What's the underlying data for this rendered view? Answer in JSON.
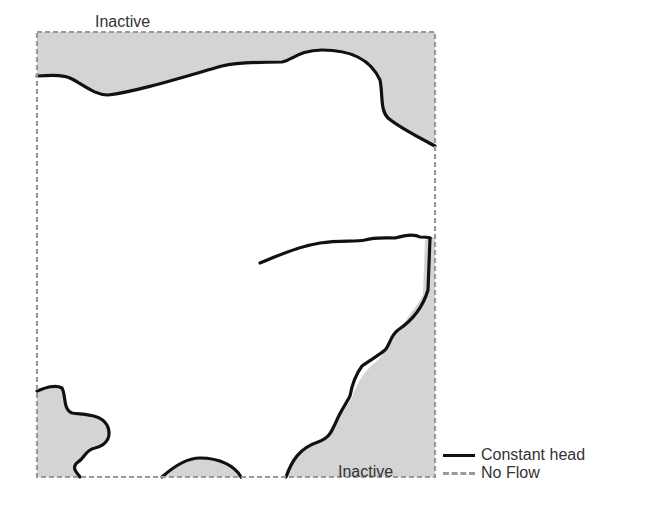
{
  "diagram": {
    "regions": [
      {
        "label": "Inactive",
        "position": "top"
      },
      {
        "label": "Inactive",
        "position": "bottom-right"
      }
    ],
    "legend": [
      {
        "symbol": "solid-black-line",
        "label": "Constant head"
      },
      {
        "symbol": "dashed-gray-line",
        "label": "No Flow"
      }
    ],
    "colors": {
      "inactive_fill": "#d4d4d4",
      "constant_head_line": "#111111",
      "no_flow_line": "#9a9a9a",
      "active_fill": "#ffffff"
    }
  }
}
